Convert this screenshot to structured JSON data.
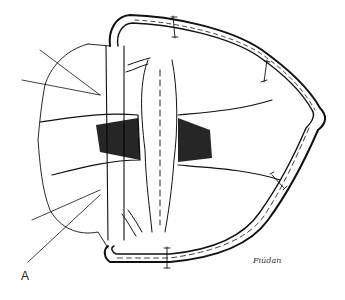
{
  "figure": {
    "panel_label": "A",
    "signature": "Fiúdan",
    "colors": {
      "ink": "#111111",
      "background": "#ffffff",
      "hatching": "#000000"
    }
  }
}
